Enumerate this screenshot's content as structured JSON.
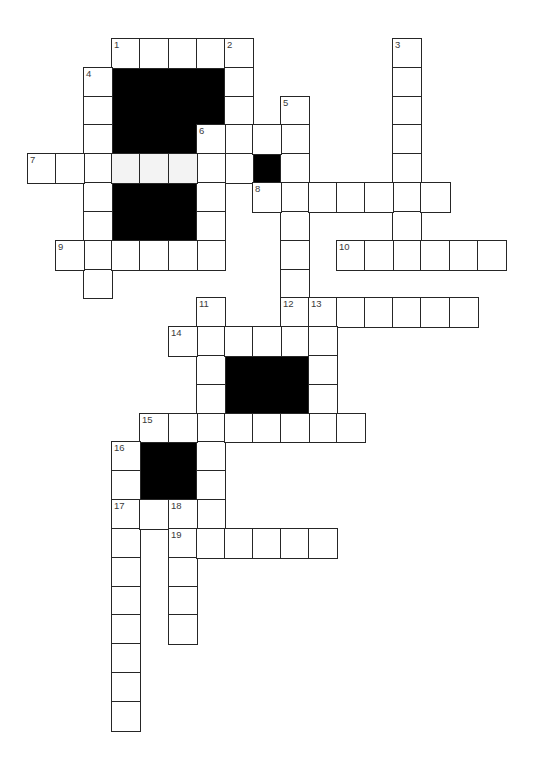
{
  "puzzle": {
    "type": "crossword",
    "grid": {
      "origin_x": 27,
      "origin_y": 38,
      "cell_w": 28.1,
      "cell_h": 28.82
    },
    "colors": {
      "line": "#262626",
      "block": "#000000",
      "cell": "#ffffff",
      "shaded_cell": "#f3f3f3",
      "number": "#3a3a3a"
    },
    "clue_numbers": [
      1,
      2,
      3,
      4,
      5,
      6,
      7,
      8,
      9,
      10,
      11,
      12,
      13,
      14,
      15,
      16,
      17,
      18,
      19
    ],
    "entries": [
      {
        "number": 1,
        "direction": "across",
        "col": 3,
        "row": 0,
        "length": 5
      },
      {
        "number": 2,
        "direction": "down",
        "col": 7,
        "row": 0,
        "length": 5
      },
      {
        "number": 3,
        "direction": "down",
        "col": 13,
        "row": 0,
        "length": 8
      },
      {
        "number": 4,
        "direction": "down",
        "col": 2,
        "row": 1,
        "length": 8
      },
      {
        "number": 5,
        "direction": "down",
        "col": 9,
        "row": 2,
        "length": 9
      },
      {
        "number": 6,
        "direction": "across",
        "col": 6,
        "row": 3,
        "length": 4
      },
      {
        "number": 6,
        "direction": "down",
        "col": 6,
        "row": 3,
        "length": 5
      },
      {
        "number": 7,
        "direction": "across",
        "col": 0,
        "row": 4,
        "length": 8
      },
      {
        "number": 8,
        "direction": "across",
        "col": 8,
        "row": 5,
        "length": 7
      },
      {
        "number": 9,
        "direction": "across",
        "col": 1,
        "row": 7,
        "length": 6
      },
      {
        "number": 10,
        "direction": "across",
        "col": 11,
        "row": 7,
        "length": 6
      },
      {
        "number": 11,
        "direction": "down",
        "col": 6,
        "row": 9,
        "length": 8
      },
      {
        "number": 12,
        "direction": "across",
        "col": 9,
        "row": 9,
        "length": 7
      },
      {
        "number": 13,
        "direction": "down",
        "col": 10,
        "row": 9,
        "length": 5
      },
      {
        "number": 14,
        "direction": "across",
        "col": 5,
        "row": 10,
        "length": 6
      },
      {
        "number": 15,
        "direction": "across",
        "col": 4,
        "row": 13,
        "length": 8
      },
      {
        "number": 16,
        "direction": "down",
        "col": 3,
        "row": 14,
        "length": 10
      },
      {
        "number": 17,
        "direction": "across",
        "col": 3,
        "row": 16,
        "length": 4
      },
      {
        "number": 18,
        "direction": "down",
        "col": 5,
        "row": 16,
        "length": 5
      },
      {
        "number": 19,
        "direction": "across",
        "col": 5,
        "row": 17,
        "length": 6
      }
    ],
    "shaded_cells": [
      [
        3,
        4
      ],
      [
        4,
        4
      ],
      [
        5,
        4
      ]
    ],
    "blocks": [
      {
        "col": 3,
        "row": 1,
        "w": 4,
        "h": 2
      },
      {
        "col": 3,
        "row": 3,
        "w": 3,
        "h": 1
      },
      {
        "col": 3,
        "row": 5,
        "w": 3,
        "h": 2
      },
      {
        "col": 8,
        "row": 4,
        "w": 1,
        "h": 1
      },
      {
        "col": 7,
        "row": 11,
        "w": 3,
        "h": 2
      },
      {
        "col": 4,
        "row": 14,
        "w": 2,
        "h": 2
      }
    ]
  }
}
